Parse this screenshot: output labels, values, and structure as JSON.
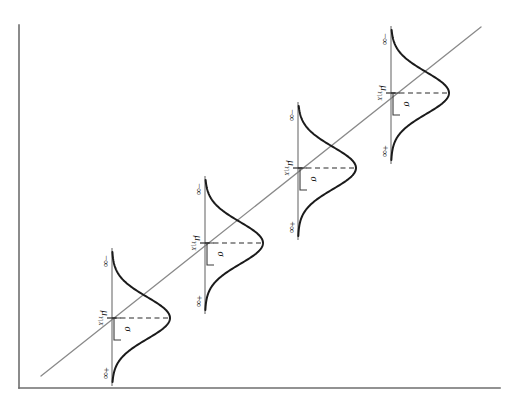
{
  "figure": {
    "kind": "statistical-diagram",
    "orientation": "rotated-90-clockwise",
    "background_color": "#ffffff",
    "axis_color": "#6e6e6e",
    "curve_color": "#1b1b1b",
    "regression_line_color": "#8a8a8a",
    "dashed_color": "#2a2a2a"
  },
  "chart_data": {
    "type": "line",
    "title": "",
    "subtitle": "",
    "xlabel": "",
    "ylabel": "",
    "grid": false,
    "legend": "none",
    "xlim": [
      0,
      515
    ],
    "ylim": [
      0,
      406
    ],
    "description_elements": [
      "frame-axes",
      "regression-line",
      "four-conditional-normal-distributions"
    ],
    "axes": {
      "vertical_axis": {
        "x": 19,
        "y_top": 25,
        "y_bottom": 388
      },
      "horizontal_axis": {
        "y": 388,
        "x_left": 19,
        "x_right": 500
      }
    },
    "regression_line": {
      "name": "regression-line",
      "x1": 41,
      "y1": 376,
      "x2": 481,
      "y2": 27
    },
    "distributions": [
      {
        "index": 1,
        "baseline_x": 112,
        "baseline_y_top": 252,
        "baseline_y_bottom": 382,
        "mean_y": 318,
        "peak_x": 170,
        "sigma_px": 22,
        "labels": {
          "upper_endpoint": "−∞",
          "lower_endpoint": "+∞",
          "mean": "μ",
          "mean_subscript": "Y|X",
          "spread": "σ"
        }
      },
      {
        "index": 2,
        "baseline_x": 205,
        "baseline_y_top": 180,
        "baseline_y_bottom": 310,
        "mean_y": 243,
        "peak_x": 263,
        "sigma_px": 22,
        "labels": {
          "upper_endpoint": "−∞",
          "lower_endpoint": "+∞",
          "mean": "μ",
          "mean_subscript": "Y|X",
          "spread": "σ"
        }
      },
      {
        "index": 3,
        "baseline_x": 298,
        "baseline_y_top": 106,
        "baseline_y_bottom": 236,
        "mean_y": 168,
        "peak_x": 356,
        "sigma_px": 22,
        "labels": {
          "upper_endpoint": "−∞",
          "lower_endpoint": "+∞",
          "mean": "μ",
          "mean_subscript": "Y|X",
          "spread": "σ"
        }
      },
      {
        "index": 4,
        "baseline_x": 391,
        "baseline_y_top": 30,
        "baseline_y_bottom": 160,
        "mean_y": 93,
        "peak_x": 449,
        "sigma_px": 22,
        "labels": {
          "upper_endpoint": "−∞",
          "lower_endpoint": "+∞",
          "mean": "μ",
          "mean_subscript": "Y|X",
          "spread": "σ"
        }
      }
    ]
  }
}
